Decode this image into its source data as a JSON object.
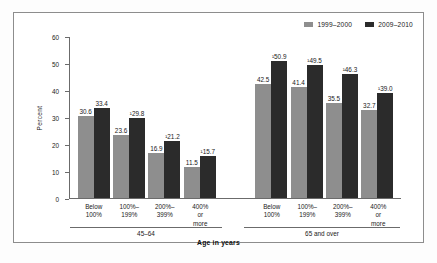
{
  "chart_data": {
    "type": "bar",
    "title": "",
    "xlabel": "Age in years",
    "ylabel": "Percent",
    "ylim": [
      0,
      60
    ],
    "yticks": [
      0,
      10,
      20,
      30,
      40,
      50,
      60
    ],
    "grid": false,
    "legend_position": "top-right",
    "categories": [
      "Below 100%",
      "100%–199%",
      "200%–399%",
      "400% or more"
    ],
    "groups": [
      {
        "name": "45–64",
        "bars": [
          {
            "category": "Below 100%",
            "series": "1999–2000",
            "value": 30.6,
            "label": "30.6"
          },
          {
            "category": "Below 100%",
            "series": "2009–2010",
            "value": 33.4,
            "label": "33.4"
          },
          {
            "category": "100%–199%",
            "series": "1999–2000",
            "value": 23.6,
            "label": "23.6"
          },
          {
            "category": "100%–199%",
            "series": "2009–2010",
            "value": 29.8,
            "label": "¹29.8"
          },
          {
            "category": "200%–399%",
            "series": "1999–2000",
            "value": 16.9,
            "label": "16.9"
          },
          {
            "category": "200%–399%",
            "series": "2009–2010",
            "value": 21.2,
            "label": "¹21.2"
          },
          {
            "category": "400% or more",
            "series": "1999–2000",
            "value": 11.5,
            "label": "11.5"
          },
          {
            "category": "400% or more",
            "series": "2009–2010",
            "value": 15.7,
            "label": "¹15.7"
          }
        ]
      },
      {
        "name": "65 and over",
        "bars": [
          {
            "category": "Below 100%",
            "series": "1999–2000",
            "value": 42.5,
            "label": "42.5"
          },
          {
            "category": "Below 100%",
            "series": "2009–2010",
            "value": 50.9,
            "label": "¹50.9"
          },
          {
            "category": "100%–199%",
            "series": "1999–2000",
            "value": 41.4,
            "label": "41.4"
          },
          {
            "category": "100%–199%",
            "series": "2009–2010",
            "value": 49.5,
            "label": "¹49.5"
          },
          {
            "category": "200%–399%",
            "series": "1999–2000",
            "value": 35.5,
            "label": "35.5"
          },
          {
            "category": "200%–399%",
            "series": "2009–2010",
            "value": 46.3,
            "label": "¹46.3"
          },
          {
            "category": "400% or more",
            "series": "1999–2000",
            "value": 32.7,
            "label": "32.7"
          },
          {
            "category": "400% or more",
            "series": "2009–2010",
            "value": 39.0,
            "label": "¹39.0"
          }
        ]
      }
    ],
    "series": [
      {
        "name": "1999–2000",
        "color": "#8e8e8e"
      },
      {
        "name": "2009–2010",
        "color": "#2b2b2b"
      }
    ]
  },
  "legend": {
    "items": [
      {
        "label": "1999–2000",
        "color": "#8e8e8e"
      },
      {
        "label": "2009–2010",
        "color": "#2b2b2b"
      }
    ]
  },
  "axis": {
    "y_label": "Percent",
    "x_label": "Age in years",
    "y_ticks": [
      "0",
      "10",
      "20",
      "30",
      "40",
      "50",
      "60"
    ]
  }
}
